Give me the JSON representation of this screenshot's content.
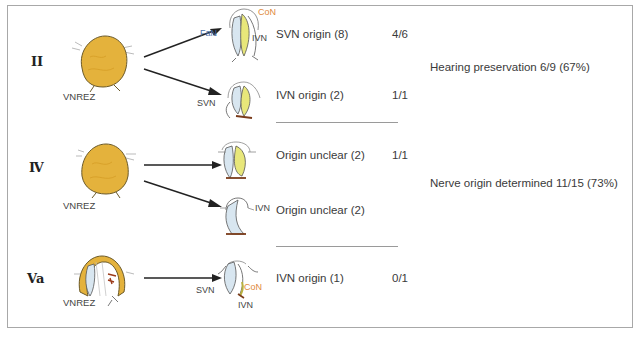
{
  "colors": {
    "tumor": "#e4b23c",
    "tumor_stroke": "#6b5a2a",
    "nerve_yellow": "#e8e77a",
    "nerve_blue": "#d8e6f0",
    "label_orange": "#e08a3c",
    "label_blue": "#4a6fa8",
    "text": "#3a3a3a",
    "border": "#a8a8a8"
  },
  "rows": [
    {
      "type": "II",
      "tumor_label": "VNREZ",
      "outcomes": [
        {
          "nerve_labels": {
            "FaN": "FaN",
            "CoN": "CoN",
            "IVN": "IVN"
          },
          "text": "SVN origin (8)",
          "ratio": "4/6"
        },
        {
          "nerve_labels": {
            "SVN": "SVN"
          },
          "text": "IVN origin (2)",
          "ratio": "1/1"
        }
      ]
    },
    {
      "type": "Ⅳ",
      "tumor_label": "VNREZ",
      "outcomes": [
        {
          "nerve_labels": {},
          "text": "Origin unclear (2)",
          "ratio": "1/1"
        },
        {
          "nerve_labels": {
            "IVN": "IVN"
          },
          "text": "Origin unclear (2)",
          "ratio": ""
        }
      ]
    },
    {
      "type": "Va",
      "tumor_label": "VNREZ",
      "outcomes": [
        {
          "nerve_labels": {
            "SVN": "SVN",
            "CoN": "CoN",
            "IVN": "IVN"
          },
          "text": "IVN origin (1)",
          "ratio": "0/1"
        }
      ]
    }
  ],
  "summary": {
    "hearing": "Hearing preservation 6/9 (67%)",
    "nerve_origin": "Nerve origin determined 11/15 (73%)"
  }
}
